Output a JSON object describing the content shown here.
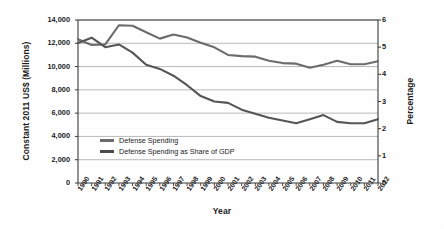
{
  "chart_data": {
    "type": "line",
    "title": "",
    "xlabel": "Year",
    "ylabel": "Constant 2011 US$ (Millions)",
    "y2label": "Percentage",
    "grid": true,
    "legend_position": "inside-bottom-left",
    "x": [
      1990,
      1991,
      1992,
      1993,
      1994,
      1995,
      1996,
      1997,
      1998,
      1999,
      2000,
      2001,
      2002,
      2003,
      2004,
      2005,
      2006,
      2007,
      2008,
      2009,
      2010,
      2011,
      2012
    ],
    "categories": [
      "1990",
      "1991",
      "1992",
      "1993",
      "1994",
      "1995",
      "1996",
      "1997",
      "1998",
      "1999",
      "2000",
      "2001",
      "2002",
      "2003",
      "2004",
      "2005",
      "2006",
      "2007",
      "2008",
      "2009",
      "2010",
      "2011",
      "2012"
    ],
    "ylim": [
      0,
      14000
    ],
    "yticks": [
      0,
      2000,
      4000,
      6000,
      8000,
      10000,
      12000,
      14000
    ],
    "ytick_labels": [
      "0",
      "2,000",
      "4,000",
      "6,000",
      "8,000",
      "10,000",
      "12,000",
      "14,000"
    ],
    "y2lim": [
      0,
      6
    ],
    "y2ticks": [
      0,
      1,
      2,
      3,
      4,
      5,
      6
    ],
    "y2tick_labels": [
      "0",
      "1",
      "2",
      "3",
      "4",
      "5",
      "6"
    ],
    "series": [
      {
        "name": "Defense Spending",
        "axis": "left",
        "unit": "Constant 2011 US$ (Millions)",
        "color": "#6b6b6b",
        "values": [
          12350,
          11850,
          11900,
          13550,
          13500,
          12950,
          12400,
          12750,
          12500,
          12050,
          11650,
          11000,
          10900,
          10850,
          10500,
          10300,
          10250,
          9900,
          10150,
          10500,
          10200,
          10200,
          10450
        ]
      },
      {
        "name": "Defense Spending as Share of GDP",
        "axis": "right",
        "unit": "Percentage",
        "color": "#555555",
        "values": [
          5.15,
          5.35,
          5.0,
          5.1,
          4.8,
          4.35,
          4.2,
          3.95,
          3.6,
          3.2,
          3.0,
          2.95,
          2.7,
          2.55,
          2.4,
          2.3,
          2.2,
          2.35,
          2.5,
          2.25,
          2.2,
          2.2,
          2.35
        ]
      }
    ]
  },
  "legend": {
    "items": [
      {
        "label": "Defense Spending",
        "color": "#6b6b6b"
      },
      {
        "label": "Defense Spending as Share of GDP",
        "color": "#4a4a4a"
      }
    ]
  }
}
